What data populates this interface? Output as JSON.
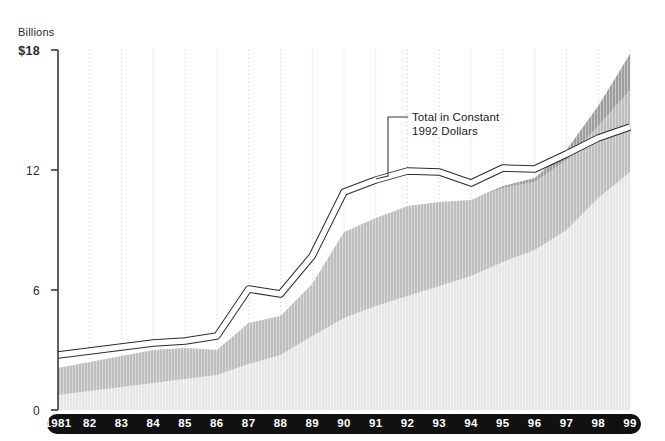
{
  "chart_data": {
    "type": "area",
    "title": "",
    "subtitle": "",
    "xlabel": "",
    "ylabel": "Billions",
    "ylim": [
      0,
      18
    ],
    "yticks": [
      0,
      6,
      12,
      18
    ],
    "ytick_labels": [
      "0",
      "6",
      "12",
      "$18"
    ],
    "grid": "vertical-dotted",
    "legend_position": "none",
    "stacked": true,
    "categories": [
      "1981",
      "82",
      "83",
      "84",
      "85",
      "86",
      "87",
      "88",
      "89",
      "90",
      "91",
      "92",
      "93",
      "94",
      "95",
      "96",
      "97",
      "98",
      "99"
    ],
    "x": [
      1981,
      1982,
      1983,
      1984,
      1985,
      1986,
      1987,
      1988,
      1989,
      1990,
      1991,
      1992,
      1993,
      1994,
      1995,
      1996,
      1997,
      1998,
      1999
    ],
    "series": [
      {
        "name": "Lower band",
        "color": "#e7e7e7",
        "values": [
          0.75,
          0.95,
          1.15,
          1.35,
          1.55,
          1.75,
          2.3,
          2.75,
          3.7,
          4.6,
          5.2,
          5.7,
          6.2,
          6.7,
          7.4,
          8.0,
          9.0,
          10.6,
          11.9
        ]
      },
      {
        "name": "Middle band",
        "color": "#bdbdbd",
        "values": [
          1.35,
          1.45,
          1.55,
          1.65,
          1.55,
          1.25,
          2.05,
          1.95,
          2.6,
          4.3,
          4.4,
          4.5,
          4.2,
          3.8,
          3.7,
          3.4,
          3.5,
          3.6,
          4.1
        ]
      },
      {
        "name": "Upper band",
        "color": "#9d9d9d",
        "values": [
          0.0,
          0.0,
          0.0,
          0.0,
          0.0,
          0.0,
          0.0,
          0.0,
          0.0,
          0.0,
          0.0,
          0.0,
          0.0,
          0.0,
          0.1,
          0.2,
          0.5,
          1.0,
          1.8
        ]
      }
    ],
    "total_stacked": [
      2.1,
      2.4,
      2.7,
      3.0,
      3.1,
      3.0,
      4.35,
      4.7,
      6.3,
      8.9,
      9.6,
      10.2,
      10.4,
      10.5,
      11.2,
      11.6,
      13.0,
      15.2,
      17.8
    ],
    "overlay_line": {
      "name": "Total in Constant 1992 Dollars",
      "color": "#ffffff",
      "outline_color": "#2b2b2b",
      "values": [
        2.75,
        2.95,
        3.15,
        3.35,
        3.45,
        3.7,
        6.05,
        5.8,
        7.7,
        10.9,
        11.5,
        11.95,
        11.9,
        11.35,
        12.1,
        12.05,
        12.8,
        13.6,
        14.15
      ]
    },
    "annotation": {
      "text": "Total in Constant\n1992 Dollars",
      "leader_from_x": 1991,
      "leader_from_y": 11.5
    }
  },
  "axis": {
    "y_unit": "Billions"
  }
}
